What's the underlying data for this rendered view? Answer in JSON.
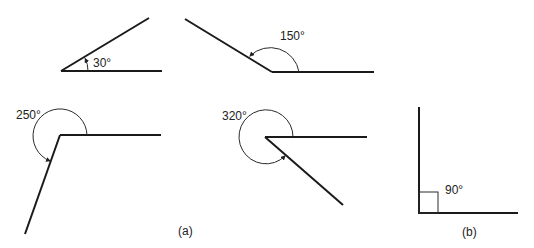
{
  "diagram": {
    "part_a": {
      "label": "(a)",
      "angles": [
        {
          "id": "angle-30",
          "value": 30,
          "label": "30°"
        },
        {
          "id": "angle-150",
          "value": 150,
          "label": "150°"
        },
        {
          "id": "angle-250",
          "value": 250,
          "label": "250°"
        },
        {
          "id": "angle-320",
          "value": 320,
          "label": "320°"
        }
      ]
    },
    "part_b": {
      "label": "(b)",
      "angles": [
        {
          "id": "angle-90",
          "value": 90,
          "label": "90°",
          "marker": "right-angle-square"
        }
      ]
    },
    "colors": {
      "line": "#1a1a1a",
      "text": "#222222",
      "background": "#ffffff"
    }
  }
}
